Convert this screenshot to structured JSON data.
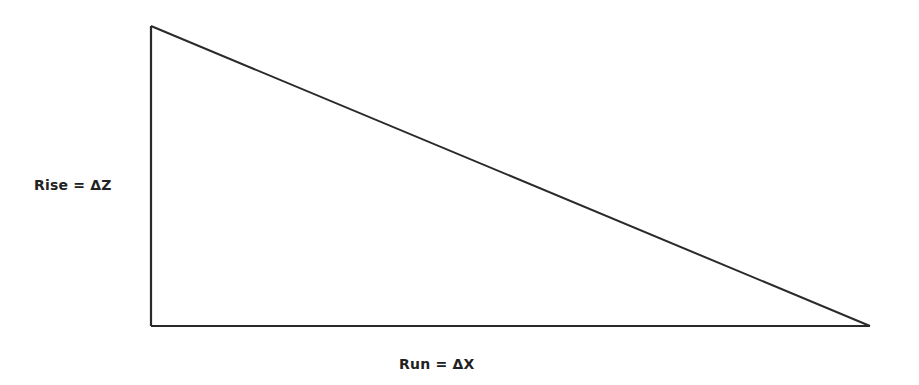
{
  "diagram": {
    "type": "right-triangle",
    "stroke_color": "#2a2a2a",
    "vertices": {
      "top": [
        151,
        26
      ],
      "bottom_left": [
        151,
        326
      ],
      "bottom_right": [
        870,
        326
      ]
    },
    "labels": {
      "rise": "Rise = ΔZ",
      "run": "Run = ΔX"
    }
  }
}
